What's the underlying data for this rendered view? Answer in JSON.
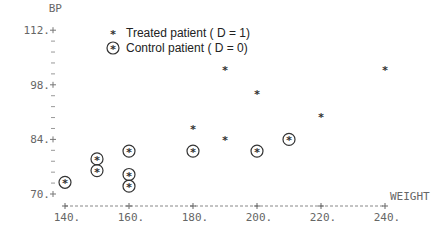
{
  "chart_data": {
    "type": "scatter",
    "title": "",
    "xlabel": "WEIGHT",
    "ylabel": "BP",
    "xlim": [
      140,
      240
    ],
    "ylim": [
      70,
      112
    ],
    "x_ticks": [
      "140.",
      "160.",
      "180.",
      "200.",
      "220.",
      "240."
    ],
    "y_ticks": [
      "70.",
      "84.",
      "98.",
      "112."
    ],
    "grid": false,
    "legend_position": "top-left",
    "legend": [
      {
        "symbol": "*",
        "label": "Treated patient (D = 1)"
      },
      {
        "symbol": "circled *",
        "label": "Control patient (D = 0)"
      }
    ],
    "series": [
      {
        "name": "Treated patient (D = 1)",
        "points": [
          {
            "x": 180,
            "y": 87
          },
          {
            "x": 190,
            "y": 84
          },
          {
            "x": 190,
            "y": 102
          },
          {
            "x": 200,
            "y": 96
          },
          {
            "x": 220,
            "y": 90
          },
          {
            "x": 240,
            "y": 102
          }
        ]
      },
      {
        "name": "Control patient (D = 0)",
        "points": [
          {
            "x": 140,
            "y": 73
          },
          {
            "x": 150,
            "y": 79
          },
          {
            "x": 150,
            "y": 76
          },
          {
            "x": 160,
            "y": 81
          },
          {
            "x": 160,
            "y": 75
          },
          {
            "x": 160,
            "y": 72
          },
          {
            "x": 180,
            "y": 81
          },
          {
            "x": 200,
            "y": 81
          },
          {
            "x": 210,
            "y": 84
          }
        ]
      }
    ]
  },
  "labels": {
    "y_axis": "BP",
    "x_axis": "WEIGHT",
    "legend_treated": "Treated patient ( D = 1)",
    "legend_control": "Control patient ( D = 0)",
    "treated_symbol": "*",
    "control_symbol": "*"
  }
}
